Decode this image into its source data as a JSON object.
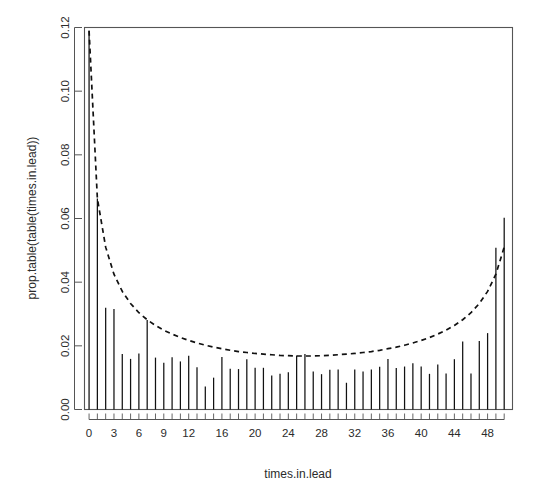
{
  "chart_data": {
    "type": "bar",
    "title": "",
    "subtitle": "",
    "xlabel": "times.in.lead",
    "ylabel": "prop.table(table(times.in.lead))",
    "xlim": [
      -0.5,
      50.5
    ],
    "ylim": [
      0.0,
      0.12
    ],
    "grid": false,
    "legend": "none",
    "x_tick_labels": [
      "0",
      "3",
      "6",
      "9",
      "12",
      "16",
      "20",
      "24",
      "28",
      "32",
      "36",
      "40",
      "44",
      "48"
    ],
    "x_tick_values": [
      0,
      3,
      6,
      9,
      12,
      16,
      20,
      24,
      28,
      32,
      36,
      40,
      44,
      48
    ],
    "y_tick_labels": [
      "0.00",
      "0.02",
      "0.04",
      "0.06",
      "0.08",
      "0.10",
      "0.12"
    ],
    "y_tick_values": [
      0.0,
      0.02,
      0.04,
      0.06,
      0.08,
      0.1,
      0.12
    ],
    "categories": [
      0,
      1,
      2,
      3,
      4,
      5,
      6,
      7,
      8,
      9,
      10,
      11,
      12,
      13,
      14,
      15,
      16,
      17,
      18,
      19,
      20,
      21,
      22,
      23,
      24,
      25,
      26,
      27,
      28,
      29,
      30,
      31,
      32,
      33,
      34,
      35,
      36,
      37,
      38,
      39,
      40,
      41,
      42,
      43,
      44,
      45,
      46,
      47,
      48,
      49,
      50
    ],
    "values": [
      0.119,
      0.0663,
      0.032,
      0.0316,
      0.0174,
      0.0159,
      0.0176,
      0.0281,
      0.0163,
      0.0147,
      0.0164,
      0.0151,
      0.0169,
      0.0133,
      0.0072,
      0.01,
      0.0165,
      0.0128,
      0.0127,
      0.0158,
      0.0131,
      0.0131,
      0.0107,
      0.0112,
      0.0117,
      0.017,
      0.0174,
      0.0119,
      0.0111,
      0.0125,
      0.0126,
      0.0084,
      0.0126,
      0.0119,
      0.0126,
      0.0134,
      0.0159,
      0.013,
      0.0135,
      0.0145,
      0.0135,
      0.0112,
      0.0141,
      0.0113,
      0.0158,
      0.0214,
      0.0113,
      0.0215,
      0.024,
      0.0508,
      0.0602
    ],
    "series": [
      {
        "name": "observed proportions",
        "style": "bar",
        "values": [
          0.119,
          0.0663,
          0.032,
          0.0316,
          0.0174,
          0.0159,
          0.0176,
          0.0281,
          0.0163,
          0.0147,
          0.0164,
          0.0151,
          0.0169,
          0.0133,
          0.0072,
          0.01,
          0.0165,
          0.0128,
          0.0127,
          0.0158,
          0.0131,
          0.0131,
          0.0107,
          0.0112,
          0.0117,
          0.017,
          0.0174,
          0.0119,
          0.0111,
          0.0125,
          0.0126,
          0.0084,
          0.0126,
          0.0119,
          0.0126,
          0.0134,
          0.0159,
          0.013,
          0.0135,
          0.0145,
          0.0135,
          0.0112,
          0.0141,
          0.0113,
          0.0158,
          0.0214,
          0.0113,
          0.0215,
          0.024,
          0.0508,
          0.0602
        ]
      },
      {
        "name": "arcsine law (dashed)",
        "style": "dashed-line",
        "values": [
          0.119,
          0.0663,
          0.051,
          0.0425,
          0.0371,
          0.0333,
          0.0304,
          0.0282,
          0.0264,
          0.0249,
          0.0237,
          0.0226,
          0.0217,
          0.0209,
          0.0202,
          0.0196,
          0.0191,
          0.0186,
          0.0182,
          0.0179,
          0.0176,
          0.0174,
          0.0172,
          0.017,
          0.0169,
          0.0168,
          0.0168,
          0.0168,
          0.0169,
          0.017,
          0.0172,
          0.0174,
          0.0176,
          0.0179,
          0.0182,
          0.0186,
          0.0191,
          0.0196,
          0.0202,
          0.0209,
          0.0217,
          0.0226,
          0.0237,
          0.0249,
          0.0264,
          0.0282,
          0.0304,
          0.0333,
          0.0371,
          0.0425,
          0.051
        ]
      }
    ]
  },
  "axis": {
    "x_title": "times.in.lead",
    "y_title": "prop.table(table(times.in.lead))"
  }
}
